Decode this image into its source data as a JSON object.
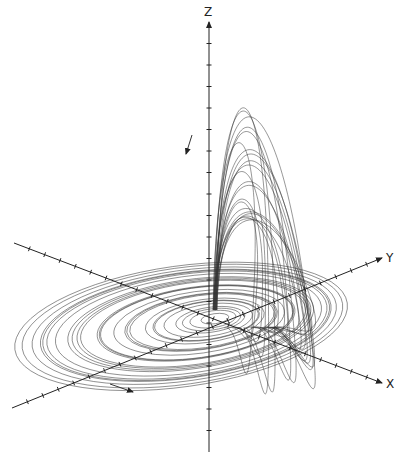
{
  "figure": {
    "title": "",
    "background": "#ffffff",
    "ink": "#222222"
  },
  "axes": {
    "origin": [
      209,
      322
    ],
    "items": [
      {
        "name": "z",
        "label": "Z",
        "from": [
          209,
          452
        ],
        "to": [
          209,
          22
        ],
        "label_pos": [
          204,
          16
        ],
        "ticks": 20,
        "arrow": true
      },
      {
        "name": "y",
        "label": "Y",
        "from": [
          12,
          408
        ],
        "to": [
          382,
          258
        ],
        "label_pos": [
          386,
          262
        ],
        "ticks": 24,
        "arrow": true
      },
      {
        "name": "x",
        "label": "X",
        "from": [
          14,
          243
        ],
        "to": [
          382,
          383
        ],
        "label_pos": [
          386,
          388
        ],
        "ticks": 24,
        "arrow": true
      }
    ]
  },
  "flow_arrows": [
    {
      "name": "descending-flow-arrow",
      "from": [
        192,
        135
      ],
      "to": [
        186,
        154
      ]
    },
    {
      "name": "rotation-flow-arrow",
      "from": [
        110,
        384
      ],
      "to": [
        133,
        392
      ]
    }
  ],
  "attractor": {
    "disk": {
      "cx": 218,
      "cy": 318,
      "rx_min": 14,
      "rx_max": 180,
      "ry_ratio": 0.36,
      "rings": 26,
      "tilt_deg": -8
    },
    "lobe": {
      "base_x_min": 213,
      "base_x_max": 304,
      "base_y": 300,
      "peak_x": 242,
      "peak_y_min": 78,
      "peak_y_max": 230,
      "loops": 22
    }
  }
}
